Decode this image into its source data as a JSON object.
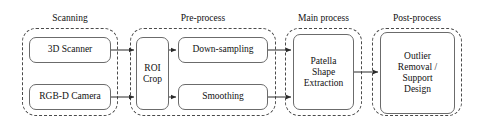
{
  "diagram": {
    "type": "flowchart",
    "orientation": "left-to-right",
    "groups": [
      {
        "id": "scanning",
        "label": "Scanning",
        "x": 22,
        "y": 28,
        "w": 96,
        "h": 88,
        "label_x": 22,
        "label_y": 13,
        "label_w": 96
      },
      {
        "id": "preprocess",
        "label": "Pre-process",
        "x": 130,
        "y": 28,
        "w": 146,
        "h": 88,
        "label_x": 130,
        "label_y": 13,
        "label_w": 146
      },
      {
        "id": "mainprocess",
        "label": "Main process",
        "x": 285,
        "y": 28,
        "w": 77,
        "h": 88,
        "label_x": 280,
        "label_y": 13,
        "label_w": 87
      },
      {
        "id": "postprocess",
        "label": "Post-process",
        "x": 372,
        "y": 28,
        "w": 90,
        "h": 88,
        "label_x": 372,
        "label_y": 13,
        "label_w": 90
      }
    ],
    "nodes": [
      {
        "id": "scanner3d",
        "label": "3D Scanner",
        "group": "scanning",
        "x": 29,
        "y": 37,
        "w": 82,
        "h": 26
      },
      {
        "id": "rgbdcamera",
        "label": "RGB-D Camera",
        "group": "scanning",
        "x": 29,
        "y": 84,
        "w": 82,
        "h": 26
      },
      {
        "id": "roicrop",
        "label": "ROI\nCrop",
        "group": "preprocess",
        "x": 136,
        "y": 37,
        "w": 33,
        "h": 73
      },
      {
        "id": "downsampling",
        "label": "Down-sampling",
        "group": "preprocess",
        "x": 178,
        "y": 37,
        "w": 90,
        "h": 26
      },
      {
        "id": "smoothing",
        "label": "Smoothing",
        "group": "preprocess",
        "x": 178,
        "y": 84,
        "w": 90,
        "h": 26
      },
      {
        "id": "patella",
        "label": "Patella\nShape\nExtraction",
        "group": "mainprocess",
        "x": 293,
        "y": 34,
        "w": 61,
        "h": 76
      },
      {
        "id": "outlier",
        "label": "Outlier\nRemoval /\nSupport\nDesign",
        "group": "postprocess",
        "x": 380,
        "y": 32,
        "w": 75,
        "h": 82
      }
    ],
    "edges": [
      {
        "id": "e1",
        "from": "scanner3d",
        "to": "roicrop",
        "x1": 111,
        "y1": 50,
        "x2": 136,
        "y2": 50
      },
      {
        "id": "e2",
        "from": "rgbdcamera",
        "to": "roicrop",
        "x1": 111,
        "y1": 97,
        "x2": 136,
        "y2": 97
      },
      {
        "id": "e3",
        "from": "roicrop",
        "to": "downsampling",
        "x1": 169,
        "y1": 50,
        "x2": 178,
        "y2": 50
      },
      {
        "id": "e4",
        "from": "roicrop",
        "to": "smoothing",
        "x1": 169,
        "y1": 97,
        "x2": 178,
        "y2": 97
      },
      {
        "id": "e5",
        "from": "downsampling",
        "to": "patella",
        "x1": 268,
        "y1": 50,
        "x2": 293,
        "y2": 50
      },
      {
        "id": "e6",
        "from": "smoothing",
        "to": "patella",
        "x1": 268,
        "y1": 97,
        "x2": 293,
        "y2": 97
      },
      {
        "id": "e7",
        "from": "patella",
        "to": "outlier",
        "x1": 354,
        "y1": 72,
        "x2": 380,
        "y2": 72
      }
    ],
    "colors": {
      "background": "#ffffff",
      "node_border": "#6b6b6b",
      "group_border": "#4a4a4a",
      "edge": "#2b2b2b",
      "text": "#111111"
    }
  }
}
